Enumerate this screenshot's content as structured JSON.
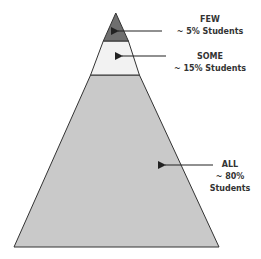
{
  "diagram": {
    "type": "pyramid",
    "tiers": [
      {
        "name": "FEW",
        "percent_label": "~ 5% Students",
        "fill": "#6f6f6f"
      },
      {
        "name": "SOME",
        "percent_label": "~ 15% Students",
        "fill": "#f2f2f2"
      },
      {
        "name": "ALL",
        "percent_label_line1": "~ 80%",
        "percent_label_line2": "Students",
        "fill": "#c9c9c9"
      }
    ],
    "outline_color": "#333333"
  }
}
